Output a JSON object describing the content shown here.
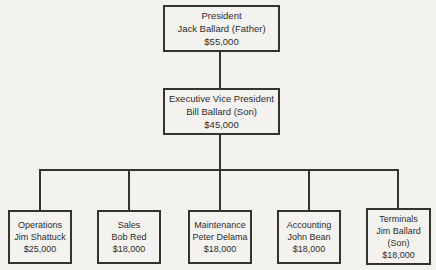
{
  "orgchart": {
    "president": {
      "title": "President",
      "name": "Jack Ballard (Father)",
      "salary": "$55,000"
    },
    "evp": {
      "title": "Executive Vice President",
      "name": "Bill Ballard (Son)",
      "salary": "$45,000"
    },
    "departments": [
      {
        "title": "Operations",
        "name": "Jim Shattuck",
        "salary": "$25,000"
      },
      {
        "title": "Sales",
        "name": "Bob Red",
        "salary": "$18,000"
      },
      {
        "title": "Maintenance",
        "name": "Peter Delama",
        "salary": "$18,000"
      },
      {
        "title": "Accounting",
        "name": "John Bean",
        "salary": "$18,000"
      },
      {
        "title": "Terminals",
        "name": "Jim Ballard (Son)",
        "salary": "$18,000"
      }
    ],
    "colors": {
      "background": "#f2f1ee",
      "line": "#34332f",
      "text": "#2e2d2b"
    }
  }
}
